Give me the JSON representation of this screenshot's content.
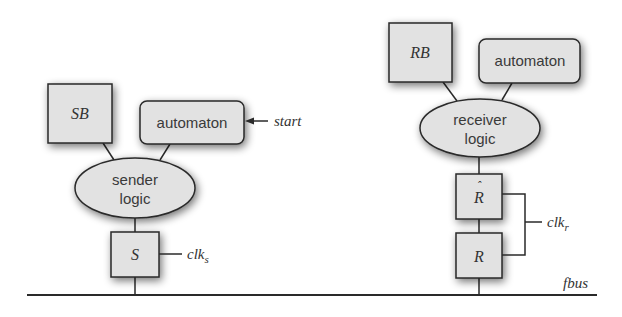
{
  "colors": {
    "node_fill": "#e2e2e2",
    "stroke": "#2a2a2a",
    "text": "#3a3a3a",
    "background": "#ffffff"
  },
  "sender": {
    "buffer_label": "SB",
    "automaton_label": "automaton",
    "start_label": "start",
    "logic_line1": "sender",
    "logic_line2": "logic",
    "register_label": "S",
    "clock_label": "clk",
    "clock_sub": "s"
  },
  "receiver": {
    "buffer_label": "RB",
    "automaton_label": "automaton",
    "logic_line1": "receiver",
    "logic_line2": "logic",
    "register_hat_label": "R",
    "register_label": "R",
    "clock_label": "clk",
    "clock_sub": "r"
  },
  "bus": {
    "label": "fbus"
  }
}
